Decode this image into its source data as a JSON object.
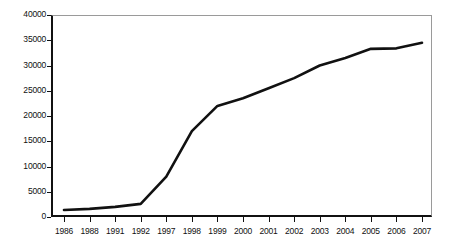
{
  "chart_data": {
    "type": "line",
    "title": "",
    "subtitle": "",
    "xlabel": "",
    "ylabel": "",
    "categories": [
      "1986",
      "1988",
      "1991",
      "1992",
      "1997",
      "1998",
      "1999",
      "2000",
      "2001",
      "2002",
      "2003",
      "2004",
      "2005",
      "2006",
      "2007"
    ],
    "values": [
      1400,
      1600,
      2000,
      2600,
      8000,
      17000,
      22000,
      23500,
      25500,
      27500,
      30000,
      31500,
      33300,
      33400,
      34500
    ],
    "series": [
      {
        "name": "",
        "values": [
          1400,
          1600,
          2000,
          2600,
          8000,
          17000,
          22000,
          23500,
          25500,
          27500,
          30000,
          31500,
          33300,
          33400,
          34500
        ]
      }
    ],
    "ylim": [
      0,
      40000
    ],
    "y_ticks": [
      0,
      5000,
      10000,
      15000,
      20000,
      25000,
      30000,
      35000,
      40000
    ],
    "y_tick_labels": [
      "0",
      "5000",
      "10000",
      "15000",
      "20000",
      "25000",
      "30000",
      "35000",
      "40000"
    ],
    "x_tick_labels": [
      "1986",
      "1988",
      "1991",
      "1992",
      "1997",
      "1998",
      "1999",
      "2000",
      "2001",
      "2002",
      "2003",
      "2004",
      "2005",
      "2006",
      "2007"
    ],
    "grid": false,
    "legend": "none",
    "line_color": "#111111",
    "line_width": 2.6,
    "markers": false,
    "background_color": "#ffffff",
    "axis_color": "#111111",
    "frame_color": "#9a9a9a",
    "annotations": []
  }
}
